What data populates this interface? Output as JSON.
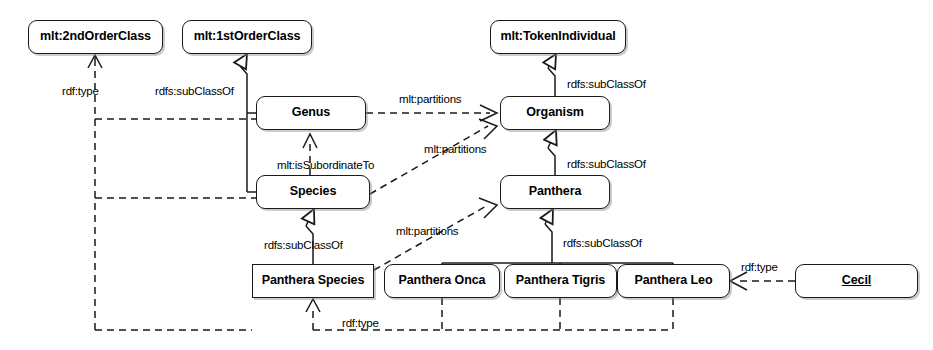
{
  "diagram": {
    "colors": {
      "stroke": "#1a1a1a",
      "background": "#ffffff",
      "text": "#000000"
    },
    "nodes": [
      {
        "id": "secondOrderClass",
        "label": "mlt:2ndOrderClass",
        "x": 28,
        "y": 20,
        "w": 135,
        "h": 34,
        "shape": "rounded",
        "kind": "meta"
      },
      {
        "id": "firstOrderClass",
        "label": "mlt:1stOrderClass",
        "x": 182,
        "y": 20,
        "w": 130,
        "h": 34,
        "shape": "rounded",
        "kind": "meta"
      },
      {
        "id": "tokenIndividual",
        "label": "mlt:TokenIndividual",
        "x": 490,
        "y": 20,
        "w": 136,
        "h": 34,
        "shape": "rounded",
        "kind": "meta"
      },
      {
        "id": "genus",
        "label": "Genus",
        "x": 256,
        "y": 96,
        "w": 110,
        "h": 34,
        "shape": "rounded",
        "kind": "class"
      },
      {
        "id": "organism",
        "label": "Organism",
        "x": 500,
        "y": 96,
        "w": 110,
        "h": 34,
        "shape": "rounded",
        "kind": "class"
      },
      {
        "id": "species",
        "label": "Species",
        "x": 256,
        "y": 175,
        "w": 114,
        "h": 34,
        "shape": "rounded",
        "kind": "class"
      },
      {
        "id": "panthera",
        "label": "Panthera",
        "x": 500,
        "y": 175,
        "w": 110,
        "h": 34,
        "shape": "rounded",
        "kind": "class"
      },
      {
        "id": "pantheraSpecies",
        "label": "Panthera Species",
        "x": 252,
        "y": 264,
        "w": 122,
        "h": 34,
        "shape": "square",
        "kind": "class"
      },
      {
        "id": "pantheraOnca",
        "label": "Panthera Onca",
        "x": 384,
        "y": 264,
        "w": 116,
        "h": 34,
        "shape": "rounded",
        "kind": "class"
      },
      {
        "id": "pantheraTigris",
        "label": "Panthera Tigris",
        "x": 504,
        "y": 264,
        "w": 113,
        "h": 34,
        "shape": "rounded",
        "kind": "class"
      },
      {
        "id": "pantheraLeo",
        "label": "Panthera Leo",
        "x": 617,
        "y": 264,
        "w": 113,
        "h": 34,
        "shape": "rounded",
        "kind": "class"
      },
      {
        "id": "cecil",
        "label": "Cecil",
        "x": 795,
        "y": 264,
        "w": 123,
        "h": 34,
        "shape": "rounded",
        "kind": "instance"
      }
    ],
    "edge_labels": [
      {
        "id": "rdftype-left",
        "text": "rdf:type",
        "x": 62,
        "y": 86
      },
      {
        "id": "subclassof-1st",
        "text": "rdfs:subClassOf",
        "x": 155,
        "y": 86
      },
      {
        "id": "subclassof-token",
        "text": "rdfs:subClassOf",
        "x": 567,
        "y": 79
      },
      {
        "id": "partitions-genus",
        "text": "mlt:partitions",
        "x": 399,
        "y": 94
      },
      {
        "id": "subordinate",
        "text": "mlt:isSubordinateTo",
        "x": 277,
        "y": 160
      },
      {
        "id": "partitions-species",
        "text": "mlt:partitions",
        "x": 424,
        "y": 144
      },
      {
        "id": "subclassof-organism",
        "text": "rdfs:subClassOf",
        "x": 567,
        "y": 159
      },
      {
        "id": "subclassof-pspecies",
        "text": "rdfs:subClassOf",
        "x": 264,
        "y": 240
      },
      {
        "id": "partitions-panthera",
        "text": "mlt:partitions",
        "x": 396,
        "y": 226
      },
      {
        "id": "subclassof-panthera",
        "text": "rdfs:subClassOf",
        "x": 563,
        "y": 238
      },
      {
        "id": "rdftype-bottom",
        "text": "rdf:type",
        "x": 342,
        "y": 318
      },
      {
        "id": "rdftype-cecil",
        "text": "rdf:type",
        "x": 741,
        "y": 262
      }
    ],
    "relations": [
      {
        "from": "genus",
        "to": "secondOrderClass",
        "type": "rdf:type"
      },
      {
        "from": "species",
        "to": "secondOrderClass",
        "type": "rdf:type"
      },
      {
        "from": "pantheraSpecies",
        "to": "secondOrderClass",
        "type": "rdf:type"
      },
      {
        "from": "genus",
        "to": "firstOrderClass",
        "type": "rdfs:subClassOf"
      },
      {
        "from": "species",
        "to": "firstOrderClass",
        "type": "rdfs:subClassOf"
      },
      {
        "from": "organism",
        "to": "tokenIndividual",
        "type": "rdfs:subClassOf"
      },
      {
        "from": "panthera",
        "to": "organism",
        "type": "rdfs:subClassOf"
      },
      {
        "from": "pantheraSpecies",
        "to": "panthera",
        "type": "rdfs:subClassOf"
      },
      {
        "from": "pantheraOnca",
        "to": "panthera",
        "type": "rdfs:subClassOf"
      },
      {
        "from": "pantheraTigris",
        "to": "panthera",
        "type": "rdfs:subClassOf"
      },
      {
        "from": "pantheraLeo",
        "to": "panthera",
        "type": "rdfs:subClassOf"
      },
      {
        "from": "species",
        "to": "genus",
        "type": "mlt:isSubordinateTo"
      },
      {
        "from": "genus",
        "to": "organism",
        "type": "mlt:partitions"
      },
      {
        "from": "species",
        "to": "organism",
        "type": "mlt:partitions"
      },
      {
        "from": "pantheraSpecies",
        "to": "panthera",
        "type": "mlt:partitions"
      },
      {
        "from": "pantheraOnca",
        "to": "pantheraSpecies",
        "type": "rdf:type"
      },
      {
        "from": "pantheraTigris",
        "to": "pantheraSpecies",
        "type": "rdf:type"
      },
      {
        "from": "pantheraLeo",
        "to": "pantheraSpecies",
        "type": "rdf:type"
      },
      {
        "from": "cecil",
        "to": "pantheraLeo",
        "type": "rdf:type"
      }
    ]
  }
}
